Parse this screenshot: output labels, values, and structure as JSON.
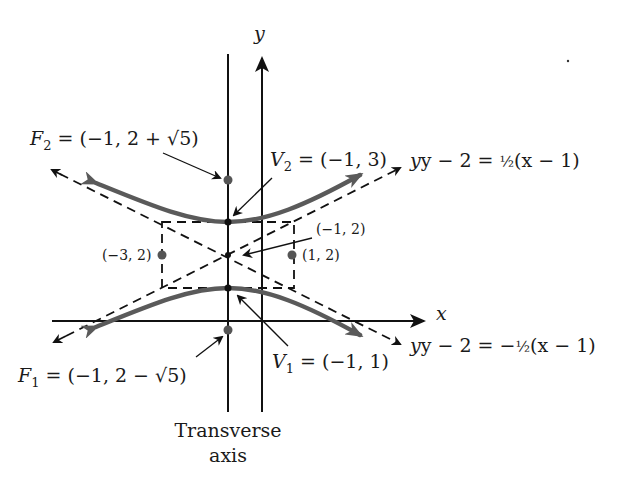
{
  "figure": {
    "type": "hyperbola-diagram",
    "axes": {
      "x_label": "x",
      "y_label": "y"
    },
    "transverse_axis_label_line1": "Transverse",
    "transverse_axis_label_line2": "axis",
    "center": {
      "label": "(−1, 2)",
      "x": -1,
      "y": 2
    },
    "vertices": [
      {
        "name": "V",
        "sub": "2",
        "rest": " = (−1, 3)",
        "x": -1,
        "y": 3
      },
      {
        "name": "V",
        "sub": "1",
        "rest": " = (−1, 1)",
        "x": -1,
        "y": 1
      }
    ],
    "foci": [
      {
        "name": "F",
        "sub": "2",
        "rest": " = (−1, 2 + √5)",
        "x": -1,
        "y": "2+√5"
      },
      {
        "name": "F",
        "sub": "1",
        "rest": " = (−1, 2 − √5)",
        "x": -1,
        "y": "2−√5"
      }
    ],
    "co_vertices": [
      {
        "label": "(−3, 2)",
        "x": -3,
        "y": 2
      },
      {
        "label": "(1, 2)",
        "x": 1,
        "y": 2
      }
    ],
    "asymptotes": [
      {
        "lhs": "y − 2 = ",
        "coef": "½",
        "rhs": "(x − 1)"
      },
      {
        "lhs": "y − 2 = −",
        "coef": "½",
        "rhs": "(x − 1)"
      }
    ],
    "colors": {
      "curve": "#5a5a5a",
      "lines": "#111111",
      "background": "#ffffff"
    }
  }
}
